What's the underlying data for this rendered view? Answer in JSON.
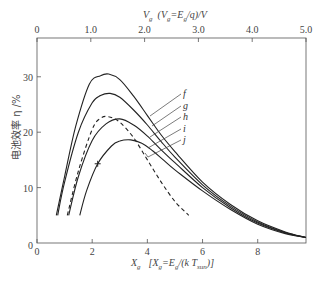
{
  "chart_data": {
    "type": "line",
    "title": "",
    "xlabel": "X_g  [X_g = E_g/(k T_sun)]",
    "xlabel_parts": {
      "main": "X",
      "sub": "g",
      "bracket": "[X",
      "bsub": "g",
      "eq": "=E",
      "esub": "g",
      "rest": "/(k T",
      "tsub": "sun",
      "close": ")]"
    },
    "x2label": "V_g  (V_g = E_g/q)/V",
    "x2label_parts": {
      "main": "V",
      "sub": "g",
      "paren": "(V",
      "psub": "g",
      "eq": "=E",
      "esub": "g",
      "rest": "/q)/V"
    },
    "ylabel": "电池效率 η /%",
    "xlim": [
      0,
      9.75
    ],
    "ylim": [
      0,
      37
    ],
    "x2lim": [
      0,
      5.0
    ],
    "x_ticks": [
      0,
      2,
      4,
      6,
      8
    ],
    "x_tick_labels": [
      "0",
      "2",
      "4",
      "6",
      "8"
    ],
    "y_ticks": [
      0,
      10,
      20,
      30
    ],
    "y_tick_labels": [
      "0",
      "10",
      "20",
      "30"
    ],
    "x2_ticks": [
      0,
      1.0,
      2.0,
      3.0,
      4.0,
      5.0
    ],
    "x2_tick_labels": [
      "0",
      "1.0",
      "2.0",
      "3.0",
      "4.0",
      "5.0"
    ],
    "grid": false,
    "series": [
      {
        "name": "f",
        "style": "solid",
        "x": [
          0.7,
          1.0,
          1.4,
          1.9,
          2.3,
          2.6,
          3.0,
          3.5,
          4.0,
          4.5,
          5.0,
          6.0,
          7.0,
          8.0,
          9.0,
          9.75
        ],
        "y": [
          5.0,
          12.0,
          21.0,
          28.7,
          30.2,
          30.5,
          29.5,
          26.5,
          23.0,
          19.5,
          16.5,
          11.0,
          7.0,
          4.0,
          2.0,
          1.0
        ]
      },
      {
        "name": "g",
        "style": "solid",
        "x": [
          0.75,
          1.0,
          1.5,
          2.0,
          2.3,
          2.65,
          3.0,
          3.5,
          4.0,
          4.5,
          5.0,
          6.0,
          7.0,
          8.0,
          9.0,
          9.75
        ],
        "y": [
          5.0,
          11.0,
          20.0,
          25.3,
          26.6,
          27.0,
          26.3,
          24.0,
          21.3,
          18.3,
          15.5,
          10.5,
          6.7,
          3.8,
          1.9,
          1.0
        ]
      },
      {
        "name": "h",
        "style": "solid",
        "x": [
          1.15,
          1.5,
          2.0,
          2.5,
          3.0,
          3.5,
          4.0,
          4.5,
          5.0,
          6.0,
          7.0,
          8.0,
          9.0,
          9.75
        ],
        "y": [
          5.0,
          12.0,
          18.5,
          21.5,
          22.4,
          21.3,
          19.3,
          16.8,
          14.5,
          10.0,
          6.4,
          3.6,
          1.8,
          1.0
        ]
      },
      {
        "name": "i",
        "style": "dashed",
        "x": [
          1.1,
          1.5,
          2.0,
          2.3,
          2.6,
          3.0,
          3.5,
          4.0,
          4.5,
          5.0,
          5.5
        ],
        "y": [
          5.0,
          13.0,
          20.5,
          22.5,
          22.8,
          21.8,
          19.0,
          15.0,
          11.0,
          7.5,
          5.0
        ]
      },
      {
        "name": "j",
        "style": "solid",
        "x": [
          1.55,
          1.8,
          2.2,
          2.7,
          3.0,
          3.4,
          3.8,
          4.2,
          4.6,
          5.0,
          6.0,
          7.0,
          8.0,
          9.0,
          9.75
        ],
        "y": [
          5.0,
          9.5,
          14.3,
          17.5,
          18.4,
          18.6,
          18.0,
          16.6,
          14.9,
          13.2,
          9.4,
          6.1,
          3.4,
          1.7,
          1.0
        ]
      }
    ],
    "annotations": [
      {
        "type": "marker",
        "symbol": "+",
        "series": "j",
        "x": 2.2,
        "y": 14.3
      }
    ],
    "legend": {
      "position": "inline-right-of-peaks",
      "entries": [
        "f",
        "g",
        "h",
        "i",
        "j"
      ]
    }
  }
}
